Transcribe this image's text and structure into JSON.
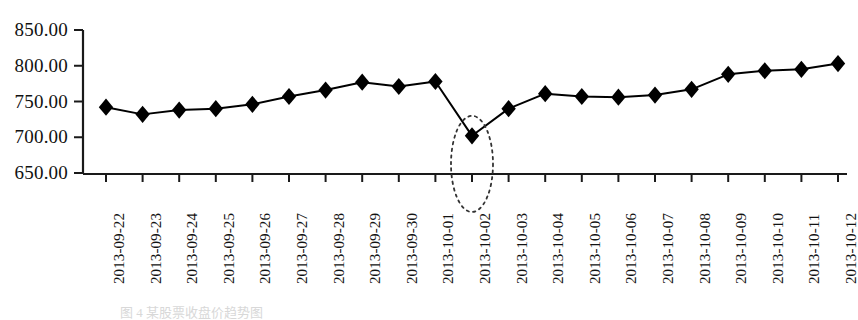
{
  "figure": {
    "background_color": "#ffffff",
    "line_color": "#000000",
    "marker_color": "#000000",
    "axis_color": "#1a1a1a",
    "annotation_color": "#333333"
  },
  "caption": {
    "text": "图 4  某股票收盘价趋势图"
  },
  "annotation": {
    "type": "dotted-ellipse",
    "target_category": "2013-10-02",
    "target_value": 702,
    "label": "highlighted outlier"
  },
  "chart_data": {
    "type": "line",
    "title": "",
    "subtitle": "",
    "xlabel": "",
    "ylabel": "",
    "grid": false,
    "legend": false,
    "legend_position": "none",
    "marker": "diamond",
    "ylim": [
      650,
      850
    ],
    "ytick_labels": [
      "850.00",
      "800.00",
      "750.00",
      "700.00",
      "650.00"
    ],
    "yticks": [
      850,
      800,
      750,
      700,
      650
    ],
    "categories": [
      "2013-09-22",
      "2013-09-23",
      "2013-09-24",
      "2013-09-25",
      "2013-09-26",
      "2013-09-27",
      "2013-09-28",
      "2013-09-29",
      "2013-09-30",
      "2013-10-01",
      "2013-10-02",
      "2013-10-03",
      "2013-10-04",
      "2013-10-05",
      "2013-10-06",
      "2013-10-07",
      "2013-10-08",
      "2013-10-09",
      "2013-10-10",
      "2013-10-11",
      "2013-10-12"
    ],
    "values": [
      742,
      732,
      738,
      740,
      746,
      757,
      766,
      777,
      771,
      778,
      702,
      740,
      761,
      757,
      756,
      759,
      767,
      788,
      793,
      795,
      803
    ]
  }
}
